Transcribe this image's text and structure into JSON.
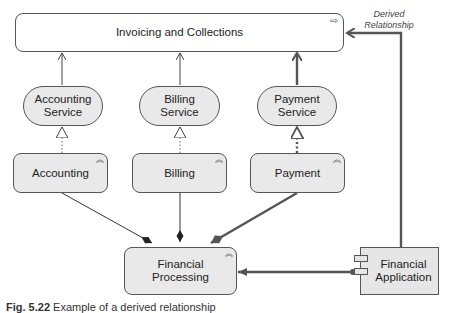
{
  "diagram": {
    "title_element": {
      "label": "Invoicing and Collections",
      "type": "business-process-or-function",
      "icon": "process-arrow-icon"
    },
    "services": [
      {
        "label": "Accounting Service",
        "line1": "Accounting",
        "line2": "Service"
      },
      {
        "label": "Billing Service",
        "line1": "Billing",
        "line2": "Service"
      },
      {
        "label": "Payment Service",
        "line1": "Payment",
        "line2": "Service"
      }
    ],
    "functions": [
      {
        "label": "Accounting",
        "icon": "function-chevron-icon"
      },
      {
        "label": "Billing",
        "icon": "function-chevron-icon"
      },
      {
        "label": "Payment",
        "icon": "function-chevron-icon"
      }
    ],
    "aggregate": {
      "line1": "Financial",
      "line2": "Processing",
      "icon": "function-chevron-icon"
    },
    "application": {
      "line1": "Financial",
      "line2": "Application",
      "icon": "component-icon"
    },
    "derived_label": {
      "line1": "Derived",
      "line2": "Relationship"
    },
    "relationships": [
      {
        "from": "Accounting Service",
        "to": "Invoicing and Collections",
        "type": "serving"
      },
      {
        "from": "Billing Service",
        "to": "Invoicing and Collections",
        "type": "serving"
      },
      {
        "from": "Payment Service",
        "to": "Invoicing and Collections",
        "type": "serving",
        "emphasis": "derived-path"
      },
      {
        "from": "Accounting",
        "to": "Accounting Service",
        "type": "realization"
      },
      {
        "from": "Billing",
        "to": "Billing Service",
        "type": "realization"
      },
      {
        "from": "Payment",
        "to": "Payment Service",
        "type": "realization",
        "emphasis": "derived-path"
      },
      {
        "from": "Financial Processing",
        "to": "Accounting",
        "type": "composition"
      },
      {
        "from": "Financial Processing",
        "to": "Billing",
        "type": "composition"
      },
      {
        "from": "Financial Processing",
        "to": "Payment",
        "type": "composition",
        "emphasis": "derived-path"
      },
      {
        "from": "Financial Application",
        "to": "Financial Processing",
        "type": "assignment",
        "emphasis": "derived-path"
      },
      {
        "from": "Financial Application",
        "to": "Invoicing and Collections",
        "type": "serving",
        "label": "Derived Relationship"
      }
    ]
  },
  "caption": {
    "prefix": "Fig. 5.22",
    "text": "Example of a derived relationship"
  }
}
